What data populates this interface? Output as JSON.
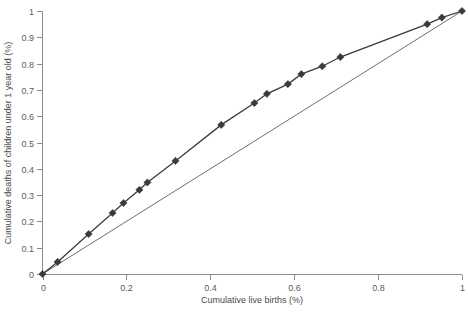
{
  "chart_data": {
    "type": "line",
    "title": "",
    "xlabel": "Cumulative live births (%)",
    "ylabel": "Cumulative deaths of children under 1 year old (%)",
    "xlim": [
      0,
      1
    ],
    "ylim": [
      0,
      1
    ],
    "grid": false,
    "legend": "none",
    "xticks": [
      "0",
      "0.2",
      "0.4",
      "0.6",
      "0.8",
      "1"
    ],
    "xtick_values": [
      0,
      0.2,
      0.4,
      0.6,
      0.8,
      1
    ],
    "yticks": [
      "0",
      "0.1",
      "0.2",
      "0.3",
      "0.4",
      "0.5",
      "0.6",
      "0.7",
      "0.8",
      "0.9",
      "1"
    ],
    "ytick_values": [
      0,
      0.1,
      0.2,
      0.3,
      0.4,
      0.5,
      0.6,
      0.7,
      0.8,
      0.9,
      1
    ],
    "series": [
      {
        "name": "Lorenz curve",
        "marker": "diamond",
        "color": "#3a3a3a",
        "x": [
          0,
          0.036,
          0.11,
          0.167,
          0.193,
          0.231,
          0.25,
          0.317,
          0.426,
          0.505,
          0.535,
          0.585,
          0.617,
          0.667,
          0.71,
          0.917,
          0.952,
          1
        ],
        "y": [
          0,
          0.046,
          0.152,
          0.232,
          0.27,
          0.32,
          0.348,
          0.43,
          0.567,
          0.65,
          0.685,
          0.722,
          0.76,
          0.79,
          0.825,
          0.95,
          0.975,
          1
        ]
      },
      {
        "name": "Line of equality",
        "marker": "none",
        "color": "#6f6f6f",
        "x": [
          0,
          1
        ],
        "y": [
          0,
          1
        ]
      }
    ]
  },
  "axes": {
    "x_axis_name": "x-axis",
    "y_axis_name": "y-axis"
  }
}
